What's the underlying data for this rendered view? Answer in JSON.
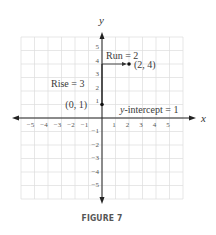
{
  "caption": "FIGURE 7",
  "chart_data": {
    "type": "scatter",
    "title": "",
    "xlabel": "x",
    "ylabel": "y",
    "xlim": [
      -6,
      6
    ],
    "ylim": [
      -6,
      6
    ],
    "grid": true,
    "x_tick_labels": [
      "−5",
      "−4",
      "−3",
      "−2",
      "−1",
      "1",
      "2",
      "3",
      "4",
      "5"
    ],
    "y_tick_labels": [
      "5",
      "4",
      "3",
      "2",
      "1",
      "−1",
      "−2",
      "−3",
      "−4",
      "−5"
    ],
    "points": [
      {
        "x": 0,
        "y": 1,
        "label": "(0, 1)"
      },
      {
        "x": 2,
        "y": 4,
        "label": "(2, 4)"
      }
    ],
    "annotations": [
      {
        "text": "Run = 2",
        "x": 0.2,
        "y": 4.6
      },
      {
        "text": "Rise = 3",
        "x": -3.7,
        "y": 2.5
      },
      {
        "text": "y-intercept = 1",
        "italic_prefix": "y",
        "rest": "-intercept = 1",
        "x": 1.5,
        "y": 0.3
      }
    ],
    "segments": [
      {
        "from": [
          0,
          4
        ],
        "to": [
          2,
          4
        ],
        "arrow": true,
        "meaning": "run"
      },
      {
        "from": [
          0,
          1
        ],
        "to": [
          0,
          4
        ],
        "arrow": false,
        "meaning": "rise"
      }
    ]
  }
}
